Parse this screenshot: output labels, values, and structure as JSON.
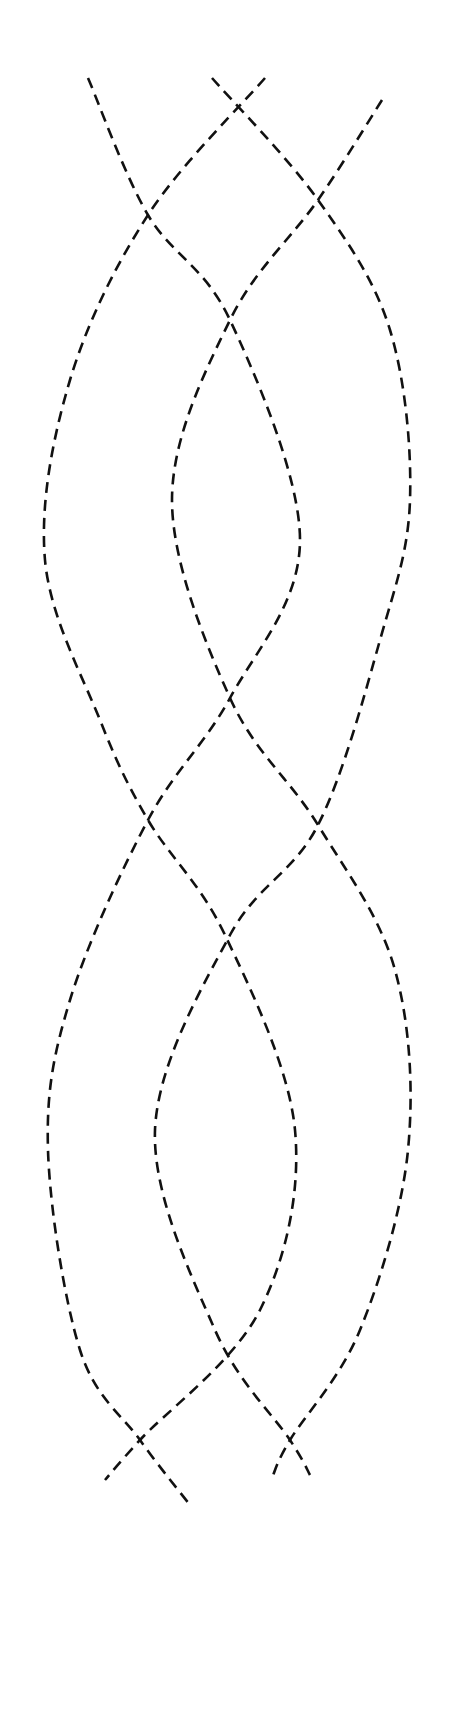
{
  "figure": {
    "stroke_color": "#111111",
    "background_color": "#ffffff",
    "line_style": "dashed",
    "strands": [
      {
        "name": "outer-left-strand",
        "points": [
          [
            88,
            78
          ],
          [
            148,
            215
          ],
          [
            230,
            320
          ],
          [
            300,
            540
          ],
          [
            230,
            698
          ],
          [
            148,
            820
          ],
          [
            70,
            1000
          ],
          [
            48,
            1150
          ],
          [
            80,
            1350
          ],
          [
            140,
            1440
          ],
          [
            190,
            1505
          ]
        ]
      },
      {
        "name": "outer-right-strand",
        "points": [
          [
            265,
            78
          ],
          [
            148,
            215
          ],
          [
            70,
            380
          ],
          [
            45,
            560
          ],
          [
            100,
            720
          ],
          [
            148,
            820
          ],
          [
            225,
            935
          ],
          [
            295,
            1130
          ],
          [
            260,
            1310
          ],
          [
            140,
            1440
          ],
          [
            105,
            1480
          ]
        ]
      },
      {
        "name": "inner-left-strand",
        "points": [
          [
            212,
            78
          ],
          [
            318,
            200
          ],
          [
            390,
            330
          ],
          [
            410,
            500
          ],
          [
            380,
            640
          ],
          [
            318,
            825
          ],
          [
            230,
            935
          ],
          [
            155,
            1130
          ],
          [
            215,
            1330
          ],
          [
            290,
            1440
          ],
          [
            310,
            1475
          ]
        ]
      },
      {
        "name": "inner-right-strand",
        "points": [
          [
            382,
            100
          ],
          [
            318,
            200
          ],
          [
            230,
            320
          ],
          [
            172,
            500
          ],
          [
            230,
            698
          ],
          [
            318,
            825
          ],
          [
            395,
            970
          ],
          [
            408,
            1150
          ],
          [
            360,
            1330
          ],
          [
            290,
            1440
          ],
          [
            272,
            1478
          ]
        ]
      }
    ]
  }
}
